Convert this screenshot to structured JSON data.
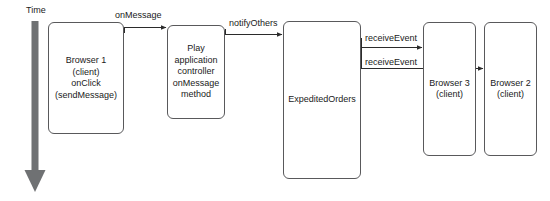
{
  "diagram": {
    "axis": {
      "name": "time-axis",
      "label": "Time",
      "direction": "down",
      "color": "#6f7173"
    },
    "style": {
      "box_border_color": "#59595b",
      "box_fill": "#ffffff",
      "text_color": "#1a1a1a",
      "arrow_color": "#2b2b2b",
      "background": "#ffffff"
    },
    "nodes": [
      {
        "id": "browser1",
        "label": "Browser 1\n(client)\nonClick\n(sendMessage)"
      },
      {
        "id": "play-controller",
        "label": "Play\napplication\ncontroller\nonMessage\nmethod"
      },
      {
        "id": "expedited-orders",
        "label": "ExpeditedOrders"
      },
      {
        "id": "browser3",
        "label": "Browser 3\n(client)"
      },
      {
        "id": "browser2",
        "label": "Browser 2\n(client)"
      }
    ],
    "edges": [
      {
        "id": "edge-onmessage",
        "label": "onMessage",
        "from": "browser1",
        "to": "play-controller"
      },
      {
        "id": "edge-notifyothers",
        "label": "notifyOthers",
        "from": "play-controller",
        "to": "expedited-orders"
      },
      {
        "id": "edge-receiveevent-1",
        "label": "receiveEvent",
        "from": "expedited-orders",
        "to": "browser3"
      },
      {
        "id": "edge-receiveevent-2",
        "label": "receiveEvent",
        "from": "expedited-orders",
        "to": "browser2"
      }
    ]
  }
}
